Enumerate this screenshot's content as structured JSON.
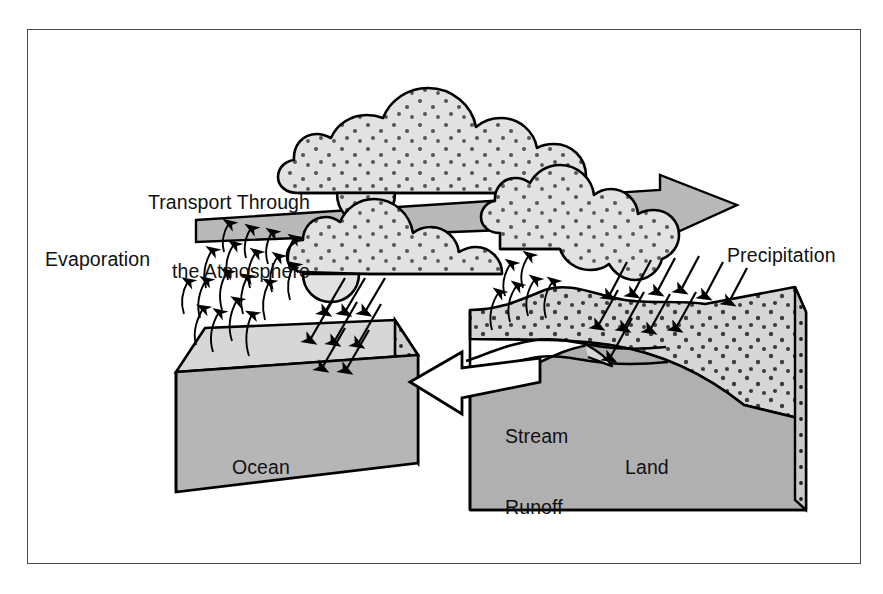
{
  "figure": {
    "border_color": "#4a4a4a",
    "background": "#ffffff"
  },
  "labels": {
    "transport_line1": "Transport Through",
    "transport_line2": "the Atmosphere",
    "evaporation": "Evaporation",
    "precipitation": "Precipitation",
    "stream_line1": "Stream",
    "stream_line2": "Runoff",
    "ocean": "Ocean",
    "land": "Land"
  },
  "palette": {
    "outline": "#000000",
    "cloud_fill": "#e2e2e2",
    "stipple": "#000000",
    "banner_arrow_fill": "#b9b9b9",
    "ocean_top": "#d7d7d7",
    "ocean_front": "#b6b6b6",
    "ocean_side": "#cfcfcf",
    "land_top": "#d6d6d6",
    "land_body": "#b0b0b0",
    "land_side": "#c8c8c8",
    "runoff_arrow_fill": "#ffffff",
    "text": "#111111"
  },
  "elements": {
    "clouds": [
      {
        "name": "upper-cloud-bank",
        "note": "large stippled cloud bank above the transport banner"
      },
      {
        "name": "middle-cloud-left",
        "note": "stippled cloud over the ocean"
      },
      {
        "name": "middle-cloud-right",
        "note": "stippled cloud over the land"
      },
      {
        "name": "small-cloud-behind-banner",
        "note": "small cloud lobe peeking below upper bank"
      }
    ],
    "arrows": {
      "transport_banner": {
        "direction": "right",
        "style": "wide block arrow"
      },
      "runoff": {
        "direction": "left",
        "style": "outlined white block arrow"
      },
      "evaporation_count": 22,
      "precipitation_ocean_count": 8,
      "precipitation_land_count": 11
    },
    "blocks": [
      {
        "name": "ocean-block",
        "label": "Ocean",
        "shape": "3d slab"
      },
      {
        "name": "land-block",
        "label": "Land",
        "shape": "3d wedge with stream channel"
      }
    ]
  }
}
